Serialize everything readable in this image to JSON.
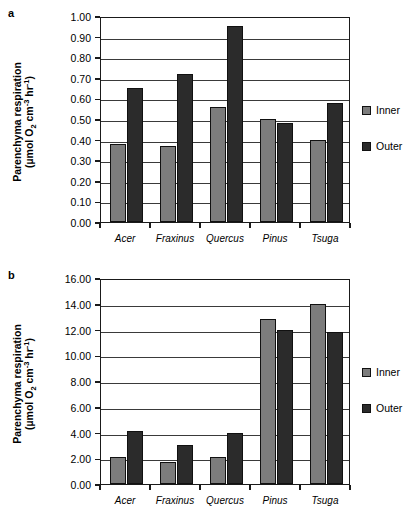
{
  "figure": {
    "panels": [
      {
        "label": "a",
        "axis_title_line1": "Parenchyma respiration",
        "axis_title_line2_pre": "(µmol O",
        "axis_title_line2_sub": "2",
        "axis_title_line2_mid": " cm",
        "axis_title_line2_sup1": "-3",
        "axis_title_line2_mid2": " hr",
        "axis_title_line2_sup2": "-1",
        "axis_title_line2_end": ")",
        "yticks": [
          "1.00",
          "0.90",
          "0.80",
          "0.70",
          "0.60",
          "0.50",
          "0.40",
          "0.30",
          "0.20",
          "0.10",
          "0.00"
        ],
        "legend": [
          {
            "label": "Inner",
            "color": "#7c7c7c"
          },
          {
            "label": "Outer",
            "color": "#2b2b2b"
          }
        ]
      },
      {
        "label": "b",
        "axis_title_line1": "Parenchyma respiration",
        "axis_title_line2_pre": "(µmol O",
        "axis_title_line2_sub": "2",
        "axis_title_line2_mid": " cm",
        "axis_title_line2_sup1": "-3",
        "axis_title_line2_mid2": " hr",
        "axis_title_line2_sup2": "-1",
        "axis_title_line2_end": ")",
        "yticks": [
          "16.00",
          "14.00",
          "12.00",
          "10.00",
          "8.00",
          "6.00",
          "4.00",
          "2.00",
          "0.00"
        ],
        "legend": [
          {
            "label": "Inner",
            "color": "#7c7c7c"
          },
          {
            "label": "Outer",
            "color": "#2b2b2b"
          }
        ]
      }
    ]
  },
  "chart_data": [
    {
      "type": "bar",
      "panel": "a",
      "title": "",
      "xlabel": "",
      "ylabel": "Parenchyma respiration (µmol O2 cm-3 hr-1)",
      "categories": [
        "Acer",
        "Fraxinus",
        "Quercus",
        "Pinus",
        "Tsuga"
      ],
      "series": [
        {
          "name": "Inner",
          "color": "#7c7c7c",
          "values": [
            0.38,
            0.37,
            0.56,
            0.5,
            0.4
          ]
        },
        {
          "name": "Outer",
          "color": "#2b2b2b",
          "values": [
            0.65,
            0.72,
            0.95,
            0.48,
            0.58
          ]
        }
      ],
      "ylim": [
        0.0,
        1.0
      ],
      "ytick_step": 0.1,
      "grid": true,
      "legend_position": "right"
    },
    {
      "type": "bar",
      "panel": "b",
      "title": "",
      "xlabel": "",
      "ylabel": "Parenchyma respiration (µmol O2 cm-3 hr-1)",
      "categories": [
        "Acer",
        "Fraxinus",
        "Quercus",
        "Pinus",
        "Tsuga"
      ],
      "series": [
        {
          "name": "Inner",
          "color": "#7c7c7c",
          "values": [
            2.1,
            1.7,
            2.1,
            12.8,
            13.95
          ]
        },
        {
          "name": "Outer",
          "color": "#2b2b2b",
          "values": [
            4.15,
            3.0,
            4.0,
            12.0,
            11.8
          ]
        }
      ],
      "ylim": [
        0.0,
        16.0
      ],
      "ytick_step": 2.0,
      "grid": true,
      "legend_position": "right"
    }
  ]
}
